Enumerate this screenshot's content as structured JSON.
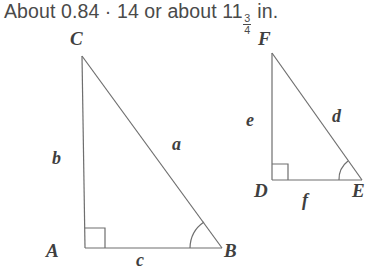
{
  "header": {
    "full_text": "About 0.84 · 14 or about 11 3/4 in.",
    "part1": "About 0.84 · 14 or about 11",
    "fraction_numerator": "3",
    "fraction_denominator": "4",
    "part2": " in.",
    "ghost_top_left": "˘",
    "ghost_top_right": "˘"
  },
  "colors": {
    "background": "#ffffff",
    "stroke": "#6e6e6e",
    "text": "#4a4a4a",
    "label": "#3f3f3f"
  },
  "figures": [
    {
      "name": "triangle-abc",
      "vertices": {
        "C": {
          "label": "C",
          "label_x": 70,
          "label_y": 6,
          "px": 82,
          "py": 34
        },
        "A": {
          "label": "A",
          "label_x": 46,
          "label_y": 218,
          "px": 85,
          "py": 226
        },
        "B": {
          "label": "B",
          "label_x": 224,
          "label_y": 218,
          "px": 222,
          "py": 226
        }
      },
      "sides": [
        {
          "label": "b",
          "x": 52,
          "y": 126,
          "between": "A-C"
        },
        {
          "label": "a",
          "x": 172,
          "y": 112,
          "between": "C-B"
        },
        {
          "label": "c",
          "x": 136,
          "y": 228,
          "between": "A-B"
        }
      ],
      "right_angle_at": "A",
      "marked_angle_at": "B"
    },
    {
      "name": "triangle-def",
      "vertices": {
        "F": {
          "label": "F",
          "label_x": 258,
          "label_y": 6,
          "px": 272,
          "py": 31
        },
        "D": {
          "label": "D",
          "label_x": 254,
          "label_y": 158,
          "px": 272,
          "py": 158
        },
        "E": {
          "label": "E",
          "label_x": 352,
          "label_y": 158,
          "px": 362,
          "py": 158
        }
      },
      "sides": [
        {
          "label": "e",
          "x": 246,
          "y": 88,
          "between": "D-F"
        },
        {
          "label": "d",
          "x": 332,
          "y": 84,
          "between": "F-E"
        },
        {
          "label": "f",
          "x": 302,
          "y": 168,
          "between": "D-E"
        }
      ],
      "right_angle_at": "D",
      "marked_angle_at": "E"
    }
  ]
}
